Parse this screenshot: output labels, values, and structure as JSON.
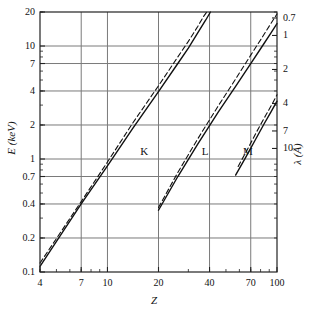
{
  "chart_data": {
    "type": "line",
    "title": "",
    "xlabel": "Z",
    "ylabel": "E (keV)",
    "y2label": "λ (Å)",
    "xscale": "log",
    "yscale": "log",
    "xlim": [
      4,
      100
    ],
    "ylim": [
      0.1,
      20
    ],
    "y2lim": [
      10,
      0.1
    ],
    "grid": true,
    "legend_position": "inline-annotation",
    "xticks": [
      4,
      7,
      10,
      20,
      40,
      70,
      100
    ],
    "xtick_labels": [
      "4",
      "7",
      "10",
      "20",
      "40",
      "70",
      "100"
    ],
    "yticks": [
      0.1,
      0.2,
      0.4,
      0.7,
      1,
      2,
      4,
      7,
      10,
      20
    ],
    "ytick_labels": [
      "0.1",
      "0.2",
      "0.4",
      "0.7",
      "1",
      "2",
      "4",
      "7",
      "10",
      "20"
    ],
    "y2ticks": [
      0.1,
      0.2,
      0.4,
      0.7,
      1,
      2,
      4,
      7,
      10
    ],
    "y2tick_labels": [
      "0.1",
      "0.2",
      "0.4",
      "0.7",
      "1",
      "2",
      "4",
      "7",
      "10"
    ],
    "annotations": [
      {
        "text": "K",
        "x": 16.5,
        "y": 1.15
      },
      {
        "text": "L",
        "x": 38.0,
        "y": 1.15
      },
      {
        "text": "M",
        "x": 66.5,
        "y": 1.15
      }
    ],
    "series": [
      {
        "name": "K",
        "style": "solid",
        "points": [
          {
            "x": 4,
            "y": 0.112
          },
          {
            "x": 7,
            "y": 0.4
          },
          {
            "x": 10,
            "y": 0.87
          },
          {
            "x": 14,
            "y": 1.84
          },
          {
            "x": 20,
            "y": 3.95
          },
          {
            "x": 26,
            "y": 7.0
          },
          {
            "x": 30,
            "y": 9.6
          },
          {
            "x": 34,
            "y": 13.0
          },
          {
            "x": 38,
            "y": 17.0
          },
          {
            "x": 40.5,
            "y": 20.0
          }
        ]
      },
      {
        "name": "K",
        "style": "dashed",
        "points": [
          {
            "x": 4,
            "y": 0.12
          },
          {
            "x": 7,
            "y": 0.42
          },
          {
            "x": 10,
            "y": 0.94
          },
          {
            "x": 14,
            "y": 2.05
          },
          {
            "x": 20,
            "y": 4.45
          },
          {
            "x": 26,
            "y": 8.0
          },
          {
            "x": 30,
            "y": 11.0
          },
          {
            "x": 34,
            "y": 14.8
          },
          {
            "x": 37,
            "y": 18.4
          },
          {
            "x": 38.5,
            "y": 20.0
          }
        ]
      },
      {
        "name": "L",
        "style": "solid",
        "points": [
          {
            "x": 20,
            "y": 0.352
          },
          {
            "x": 26,
            "y": 0.7
          },
          {
            "x": 34,
            "y": 1.35
          },
          {
            "x": 45,
            "y": 2.6
          },
          {
            "x": 57,
            "y": 4.4
          },
          {
            "x": 70,
            "y": 7.0
          },
          {
            "x": 82,
            "y": 10.0
          },
          {
            "x": 92,
            "y": 13.0
          },
          {
            "x": 100,
            "y": 15.8
          }
        ]
      },
      {
        "name": "L",
        "style": "dashed",
        "points": [
          {
            "x": 20,
            "y": 0.372
          },
          {
            "x": 26,
            "y": 0.76
          },
          {
            "x": 34,
            "y": 1.5
          },
          {
            "x": 45,
            "y": 2.95
          },
          {
            "x": 57,
            "y": 5.1
          },
          {
            "x": 70,
            "y": 8.3
          },
          {
            "x": 82,
            "y": 12.0
          },
          {
            "x": 90,
            "y": 15.0
          },
          {
            "x": 100,
            "y": 19.2
          }
        ]
      },
      {
        "name": "M",
        "style": "solid",
        "points": [
          {
            "x": 57,
            "y": 0.72
          },
          {
            "x": 65,
            "y": 1.02
          },
          {
            "x": 74,
            "y": 1.45
          },
          {
            "x": 84,
            "y": 2.05
          },
          {
            "x": 92,
            "y": 2.6
          },
          {
            "x": 100,
            "y": 3.25
          }
        ]
      },
      {
        "name": "M",
        "style": "dashed",
        "points": [
          {
            "x": 59,
            "y": 0.86
          },
          {
            "x": 67,
            "y": 1.22
          },
          {
            "x": 76,
            "y": 1.75
          },
          {
            "x": 86,
            "y": 2.45
          },
          {
            "x": 94,
            "y": 3.1
          },
          {
            "x": 100,
            "y": 3.7
          }
        ]
      }
    ]
  },
  "style": {
    "line_color": "#111111",
    "grid_color": "#7a7a7a",
    "frame_color": "#222222",
    "background": "#ffffff"
  }
}
